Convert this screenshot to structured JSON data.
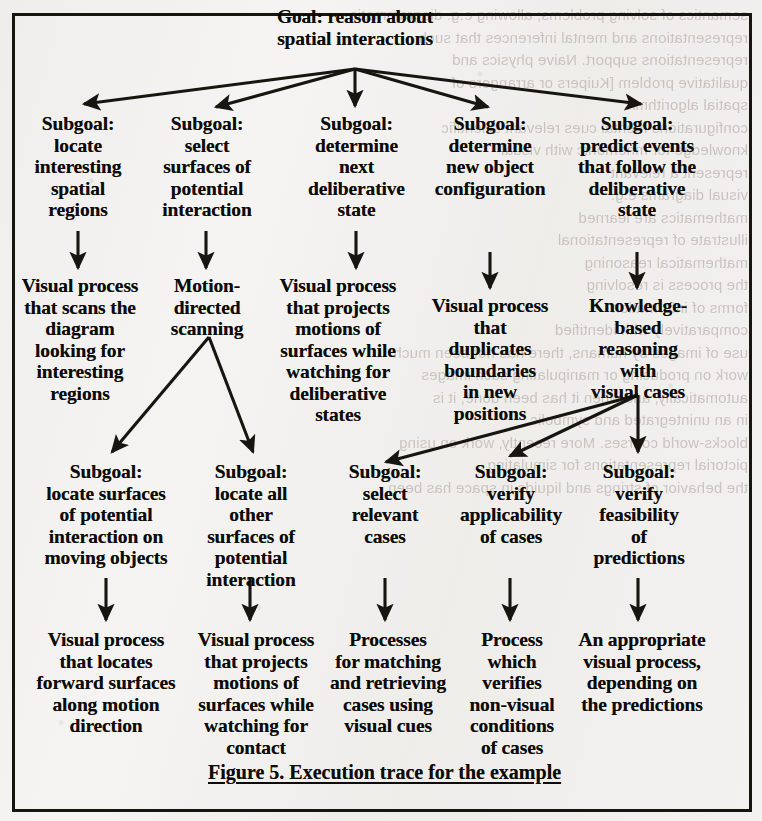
{
  "figure": {
    "caption": "Figure 5. Execution trace for the example",
    "border_color": "#17150f",
    "paper_color": "#f2f1ef",
    "ink_color": "#0c0b08"
  },
  "graph": {
    "type": "tree",
    "root": {
      "id": "goal",
      "label": "Goal: reason about\nspatial interactions"
    },
    "levels": [
      {
        "name": "level-1-subgoals",
        "nodes": [
          {
            "id": "sg-locate-regions",
            "label": "Subgoal:\nlocate\ninteresting\nspatial\nregions"
          },
          {
            "id": "sg-select-surfaces",
            "label": "Subgoal:\nselect\nsurfaces of\npotential\ninteraction"
          },
          {
            "id": "sg-next-delib",
            "label": "Subgoal:\ndetermine\nnext\ndeliberative\nstate"
          },
          {
            "id": "sg-new-object-config",
            "label": "Subgoal:\ndetermine\nnew object\nconfiguration"
          },
          {
            "id": "sg-predict-events",
            "label": "Subgoal:\npredict events\nthat follow the\ndeliberative\nstate"
          }
        ]
      },
      {
        "name": "level-2-processes",
        "nodes": [
          {
            "id": "p-scan-diagram",
            "label": "Visual process\nthat scans the\ndiagram\nlooking for\ninteresting\nregions"
          },
          {
            "id": "p-motion-scan",
            "label": "Motion-\ndirected\nscanning"
          },
          {
            "id": "p-project-delib",
            "label": "Visual process\nthat projects\nmotions of\nsurfaces while\nwatching for\ndeliberative\nstates"
          },
          {
            "id": "p-duplicate-bnd",
            "label": "Visual process\nthat\nduplicates\nboundaries\nin new\npositions"
          },
          {
            "id": "p-knowledge-based",
            "label": "Knowledge-\nbased\nreasoning\nwith\nvisual cases"
          }
        ]
      },
      {
        "name": "level-3-subgoals",
        "nodes": [
          {
            "id": "sg-surfaces-moving",
            "label": "Subgoal:\nlocate surfaces\nof potential\ninteraction on\nmoving objects"
          },
          {
            "id": "sg-all-other",
            "label": "Subgoal:\nlocate all\nother\nsurfaces of\npotential\ninteraction"
          },
          {
            "id": "sg-select-cases",
            "label": "Subgoal:\nselect\nrelevant\ncases"
          },
          {
            "id": "sg-verify-applic",
            "label": "Subgoal:\nverify\napplicability\nof cases"
          },
          {
            "id": "sg-verify-feasib",
            "label": "Subgoal:\nverify\nfeasibility\nof\npredictions"
          }
        ]
      },
      {
        "name": "level-4-processes",
        "nodes": [
          {
            "id": "p-forward-surfaces",
            "label": "Visual process\nthat locates\nforward surfaces\nalong motion\ndirection"
          },
          {
            "id": "p-project-contact",
            "label": "Visual process\nthat projects\nmotions of\nsurfaces while\nwatching for\ncontact"
          },
          {
            "id": "p-match-retrieve",
            "label": "Processes\nfor matching\nand retrieving\ncases using\nvisual cues"
          },
          {
            "id": "p-verify-nonvisual",
            "label": "Process\nwhich\nverifies\nnon-visual\nconditions\nof cases"
          },
          {
            "id": "p-appropriate",
            "label": "An appropriate\nvisual process,\ndepending on\nthe predictions"
          }
        ]
      }
    ],
    "edges": [
      {
        "from": "goal",
        "to": "sg-locate-regions"
      },
      {
        "from": "goal",
        "to": "sg-select-surfaces"
      },
      {
        "from": "goal",
        "to": "sg-next-delib"
      },
      {
        "from": "goal",
        "to": "sg-new-object-config"
      },
      {
        "from": "goal",
        "to": "sg-predict-events"
      },
      {
        "from": "sg-locate-regions",
        "to": "p-scan-diagram"
      },
      {
        "from": "sg-select-surfaces",
        "to": "p-motion-scan"
      },
      {
        "from": "sg-next-delib",
        "to": "p-project-delib"
      },
      {
        "from": "sg-new-object-config",
        "to": "p-duplicate-bnd"
      },
      {
        "from": "sg-predict-events",
        "to": "p-knowledge-based"
      },
      {
        "from": "p-motion-scan",
        "to": "sg-surfaces-moving"
      },
      {
        "from": "p-motion-scan",
        "to": "sg-all-other"
      },
      {
        "from": "p-knowledge-based",
        "to": "sg-select-cases"
      },
      {
        "from": "p-knowledge-based",
        "to": "sg-verify-applic"
      },
      {
        "from": "p-knowledge-based",
        "to": "sg-verify-feasib"
      },
      {
        "from": "sg-surfaces-moving",
        "to": "p-forward-surfaces"
      },
      {
        "from": "sg-all-other",
        "to": "p-project-contact"
      },
      {
        "from": "sg-select-cases",
        "to": "p-match-retrieve"
      },
      {
        "from": "sg-verify-applic",
        "to": "p-verify-nonvisual"
      },
      {
        "from": "sg-verify-feasib",
        "to": "p-appropriate"
      }
    ]
  },
  "bleed_through": {
    "left_column": "semantics of solving  problems;  allowing e.g. diagrammatic\nrepresentations and mental inferences that such\nrepresentations support.  Naive physics and\nqualitative problem  [Kuipers or arrangers of\nspatial algorithmic\nconfigurations mental cues  relevant  scientific\nknowledge for mnemonic with visual\nrepresent a  relevant\nvisual diagrams e.g.\nmathematics are learned\nillustrate   of representational\nmathematical reasoning\nthe  process is  resolving\nforms of information\ncomparatively with  identified\nuse of images by humans, there has not been much\nwork on producing or manipulating such images\nautomatically, and when it has been done, it is\nin an unintegrated and  symbolic\nblocks-world courses.  More recently, work on using\npictorial representations for simulating\nthe behavior of strings and liquids in space has been"
  }
}
